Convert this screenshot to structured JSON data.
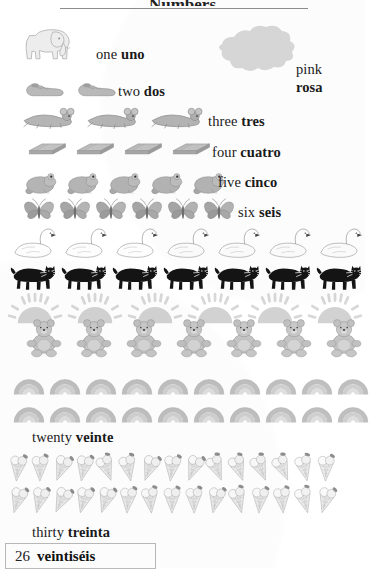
{
  "page": {
    "title_fragment": "Numbers",
    "footer": {
      "number": "26",
      "word": "veintiséis"
    }
  },
  "color_entry": {
    "english": "pink",
    "spanish": "rosa",
    "swatch_color": "#d8d8d8"
  },
  "rows": [
    {
      "id": "one",
      "english": "one",
      "spanish": "uno",
      "count": 1,
      "icon": "elephant-icon",
      "label_x": 96,
      "label_y": 47,
      "art_x": 18,
      "art_y": 24,
      "gap": 0,
      "size": 58
    },
    {
      "id": "two",
      "english": "two",
      "spanish": "dos",
      "count": 2,
      "icon": "shoe-icon",
      "label_x": 118,
      "label_y": 84,
      "art_x": 24,
      "art_y": 76,
      "gap": 10,
      "size": 42
    },
    {
      "id": "three",
      "english": "three",
      "spanish": "tres",
      "count": 3,
      "icon": "mouse-icon",
      "label_x": 208,
      "label_y": 114,
      "art_x": 22,
      "art_y": 106,
      "gap": 8,
      "size": 56
    },
    {
      "id": "four",
      "english": "four",
      "spanish": "cuatro",
      "count": 4,
      "icon": "book-icon",
      "label_x": 212,
      "label_y": 145,
      "art_x": 26,
      "art_y": 138,
      "gap": 6,
      "size": 42
    },
    {
      "id": "five",
      "english": "five",
      "spanish": "cinco",
      "count": 5,
      "icon": "frog-icon",
      "label_x": 218,
      "label_y": 175,
      "art_x": 22,
      "art_y": 166,
      "gap": 4,
      "size": 38
    },
    {
      "id": "six",
      "english": "six",
      "spanish": "seis",
      "count": 6,
      "icon": "butterfly-icon",
      "label_x": 238,
      "label_y": 205,
      "art_x": 22,
      "art_y": 196,
      "gap": 2,
      "size": 34
    },
    {
      "id": "seven",
      "english": "",
      "spanish": "",
      "count": 7,
      "icon": "swan-icon",
      "label_x": 0,
      "label_y": 0,
      "art_x": 10,
      "art_y": 226,
      "gap": 3,
      "size": 48
    },
    {
      "id": "eight",
      "english": "",
      "spanish": "",
      "count": 7,
      "icon": "cat-icon",
      "label_x": 0,
      "label_y": 0,
      "art_x": 10,
      "art_y": 258,
      "gap": 3,
      "size": 48
    },
    {
      "id": "nine",
      "english": "",
      "spanish": "",
      "count": 6,
      "icon": "sun-icon",
      "label_x": 0,
      "label_y": 0,
      "art_x": 8,
      "art_y": 292,
      "gap": 6,
      "size": 54
    },
    {
      "id": "ten",
      "english": "",
      "spanish": "",
      "count": 7,
      "icon": "teddy-bear-icon",
      "label_x": 0,
      "label_y": 0,
      "art_x": 24,
      "art_y": 318,
      "gap": 10,
      "size": 40
    }
  ],
  "twenty": {
    "english": "twenty",
    "spanish": "veinte",
    "label_x": 32,
    "label_y": 430,
    "count": 20,
    "per_row": 10,
    "icon": "rainbow-icon"
  },
  "thirty": {
    "english": "thirty",
    "spanish": "treinta",
    "label_x": 32,
    "label_y": 525,
    "count": 30,
    "per_row": 15,
    "icon": "ice-cream-cone-icon"
  }
}
